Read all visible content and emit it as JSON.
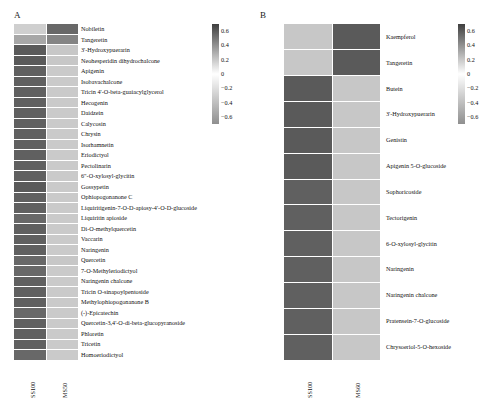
{
  "figure": {
    "background": "#ffffff",
    "panels": [
      {
        "letter": "A",
        "x_labels": [
          "SS100",
          "MS50"
        ],
        "rows": [
          {
            "label": "Nobiletin",
            "values": [
              -0.3,
              0.55
            ]
          },
          {
            "label": "Tangeretin",
            "values": [
              -0.55,
              0.45
            ]
          },
          {
            "label": "3'-Hydroxypuerarin",
            "values": [
              0.6,
              -0.35
            ]
          },
          {
            "label": "Neohesperidin dihydrochalcone",
            "values": [
              0.6,
              -0.35
            ]
          },
          {
            "label": "Apigenin",
            "values": [
              0.58,
              -0.33
            ]
          },
          {
            "label": "Isobavachalcone",
            "values": [
              0.58,
              -0.33
            ]
          },
          {
            "label": "Tricin 4'-O-beta-guaiacylglycerol",
            "values": [
              0.58,
              -0.33
            ]
          },
          {
            "label": "Hecogenin",
            "values": [
              0.58,
              -0.33
            ]
          },
          {
            "label": "Daidzein",
            "values": [
              0.58,
              -0.33
            ]
          },
          {
            "label": "Calycosin",
            "values": [
              0.58,
              -0.33
            ]
          },
          {
            "label": "Chrysin",
            "values": [
              0.58,
              -0.33
            ]
          },
          {
            "label": "Isorhamnetin",
            "values": [
              0.58,
              -0.33
            ]
          },
          {
            "label": "Eriodictyol",
            "values": [
              0.58,
              -0.33
            ]
          },
          {
            "label": "Pectolinarin",
            "values": [
              0.58,
              -0.33
            ]
          },
          {
            "label": "6\"-O-xylosyl-glycitin",
            "values": [
              0.58,
              -0.33
            ]
          },
          {
            "label": "Gossypetin",
            "values": [
              0.6,
              -0.33
            ]
          },
          {
            "label": "Ophiopogonanone C",
            "values": [
              0.58,
              -0.33
            ]
          },
          {
            "label": "Liquiritigenin-7-O-D-apiosy-4'-O-D-glucoside",
            "values": [
              0.58,
              -0.33
            ]
          },
          {
            "label": "Liquiritin apioside",
            "values": [
              0.55,
              -0.33
            ]
          },
          {
            "label": "Di-O-methylquercetin",
            "values": [
              0.58,
              -0.33
            ]
          },
          {
            "label": "Vaccarin",
            "values": [
              0.58,
              -0.33
            ]
          },
          {
            "label": "Naringenin",
            "values": [
              0.58,
              -0.33
            ]
          },
          {
            "label": "Quercetin",
            "values": [
              0.55,
              -0.35
            ]
          },
          {
            "label": "7-O-Methyleriodictyol",
            "values": [
              0.55,
              -0.33
            ]
          },
          {
            "label": "Naringenin chalcone",
            "values": [
              0.58,
              -0.33
            ]
          },
          {
            "label": "Tricin O-sinapoylpentoside",
            "values": [
              0.58,
              -0.33
            ]
          },
          {
            "label": "Methylophiopogonanone B",
            "values": [
              0.58,
              -0.33
            ]
          },
          {
            "label": "(-)-Epicatechin",
            "values": [
              0.55,
              -0.33
            ]
          },
          {
            "label": "Quercetin-3,4'-O-di-beta-glucopyranoside",
            "values": [
              0.58,
              -0.33
            ]
          },
          {
            "label": "Phloretin",
            "values": [
              0.58,
              -0.33
            ]
          },
          {
            "label": "Tricetin",
            "values": [
              0.58,
              -0.33
            ]
          },
          {
            "label": "Homoeriodictyol",
            "values": [
              0.55,
              -0.33
            ]
          }
        ],
        "colorbar": {
          "ticks": [
            "0.6",
            "0.4",
            "0.2",
            "0",
            "-0.2",
            "-0.4",
            "-0.6"
          ],
          "vmin": -0.7,
          "vmax": 0.7,
          "high_color": "#3f3f3f",
          "mid_color": "#ffffff",
          "low_color": "#8f8f8f"
        }
      },
      {
        "letter": "B",
        "x_labels": [
          "SS100",
          "MS60"
        ],
        "rows": [
          {
            "label": "Kaempferol",
            "values": [
              -0.35,
              0.6
            ]
          },
          {
            "label": "Tangeretin",
            "values": [
              -0.35,
              0.6
            ]
          },
          {
            "label": "Butein",
            "values": [
              0.6,
              -0.35
            ]
          },
          {
            "label": "3'-Hydroxypuerarin",
            "values": [
              0.6,
              -0.35
            ]
          },
          {
            "label": "Genistin",
            "values": [
              0.6,
              -0.35
            ]
          },
          {
            "label": "Apigenin 5-O-glucoside",
            "values": [
              0.6,
              -0.35
            ]
          },
          {
            "label": "Sophoricoside",
            "values": [
              0.58,
              -0.35
            ]
          },
          {
            "label": "Tectorigenin",
            "values": [
              0.58,
              -0.35
            ]
          },
          {
            "label": "6-O-xylosyl-glycitin",
            "values": [
              0.58,
              -0.35
            ]
          },
          {
            "label": "Naringenin",
            "values": [
              0.58,
              -0.35
            ]
          },
          {
            "label": "Naringenin chalcone",
            "values": [
              0.58,
              -0.35
            ]
          },
          {
            "label": "Pratensein-7-O-glucoside",
            "values": [
              0.58,
              -0.35
            ]
          },
          {
            "label": "Chrysoeriol-5-O-hexoside",
            "values": [
              0.58,
              -0.35
            ]
          }
        ],
        "colorbar": {
          "ticks": [
            "0.6",
            "0.4",
            "0.2",
            "0",
            "-0.2",
            "-0.4",
            "-0.6"
          ],
          "vmin": -0.7,
          "vmax": 0.7,
          "high_color": "#3f3f3f",
          "mid_color": "#ffffff",
          "low_color": "#8f8f8f"
        }
      }
    ]
  },
  "chart_data": {
    "type": "heatmap",
    "title": "",
    "panels": [
      {
        "name": "A",
        "columns": [
          "SS100",
          "MS50"
        ],
        "rows": [
          "Nobiletin",
          "Tangeretin",
          "3'-Hydroxypuerarin",
          "Neohesperidin dihydrochalcone",
          "Apigenin",
          "Isobavachalcone",
          "Tricin 4'-O-beta-guaiacylglycerol",
          "Hecogenin",
          "Daidzein",
          "Calycosin",
          "Chrysin",
          "Isorhamnetin",
          "Eriodictyol",
          "Pectolinarin",
          "6\"-O-xylosyl-glycitin",
          "Gossypetin",
          "Ophiopogonanone C",
          "Liquiritigenin-7-O-D-apiosy-4'-O-D-glucoside",
          "Liquiritin apioside",
          "Di-O-methylquercetin",
          "Vaccarin",
          "Naringenin",
          "Quercetin",
          "7-O-Methyleriodictyol",
          "Naringenin chalcone",
          "Tricin O-sinapoylpentoside",
          "Methylophiopogonanone B",
          "(-)-Epicatechin",
          "Quercetin-3,4'-O-di-beta-glucopyranoside",
          "Phloretin",
          "Tricetin",
          "Homoeriodictyol"
        ],
        "values": [
          [
            -0.3,
            0.55
          ],
          [
            -0.55,
            0.45
          ],
          [
            0.6,
            -0.35
          ],
          [
            0.6,
            -0.35
          ],
          [
            0.58,
            -0.33
          ],
          [
            0.58,
            -0.33
          ],
          [
            0.58,
            -0.33
          ],
          [
            0.58,
            -0.33
          ],
          [
            0.58,
            -0.33
          ],
          [
            0.58,
            -0.33
          ],
          [
            0.58,
            -0.33
          ],
          [
            0.58,
            -0.33
          ],
          [
            0.58,
            -0.33
          ],
          [
            0.58,
            -0.33
          ],
          [
            0.58,
            -0.33
          ],
          [
            0.6,
            -0.33
          ],
          [
            0.58,
            -0.33
          ],
          [
            0.58,
            -0.33
          ],
          [
            0.55,
            -0.33
          ],
          [
            0.58,
            -0.33
          ],
          [
            0.58,
            -0.33
          ],
          [
            0.58,
            -0.33
          ],
          [
            0.55,
            -0.35
          ],
          [
            0.55,
            -0.33
          ],
          [
            0.58,
            -0.33
          ],
          [
            0.58,
            -0.33
          ],
          [
            0.58,
            -0.33
          ],
          [
            0.55,
            -0.33
          ],
          [
            0.58,
            -0.33
          ],
          [
            0.58,
            -0.33
          ],
          [
            0.58,
            -0.33
          ],
          [
            0.55,
            -0.33
          ]
        ],
        "colorbar_ticks": [
          0.6,
          0.4,
          0.2,
          0,
          -0.2,
          -0.4,
          -0.6
        ],
        "zlim": [
          -0.7,
          0.7
        ]
      },
      {
        "name": "B",
        "columns": [
          "SS100",
          "MS60"
        ],
        "rows": [
          "Kaempferol",
          "Tangeretin",
          "Butein",
          "3'-Hydroxypuerarin",
          "Genistin",
          "Apigenin 5-O-glucoside",
          "Sophoricoside",
          "Tectorigenin",
          "6-O-xylosyl-glycitin",
          "Naringenin",
          "Naringenin chalcone",
          "Pratensein-7-O-glucoside",
          "Chrysoeriol-5-O-hexoside"
        ],
        "values": [
          [
            -0.35,
            0.6
          ],
          [
            -0.35,
            0.6
          ],
          [
            0.6,
            -0.35
          ],
          [
            0.6,
            -0.35
          ],
          [
            0.6,
            -0.35
          ],
          [
            0.6,
            -0.35
          ],
          [
            0.58,
            -0.35
          ],
          [
            0.58,
            -0.35
          ],
          [
            0.58,
            -0.35
          ],
          [
            0.58,
            -0.35
          ],
          [
            0.58,
            -0.35
          ],
          [
            0.58,
            -0.35
          ],
          [
            0.58,
            -0.35
          ]
        ],
        "colorbar_ticks": [
          0.6,
          0.4,
          0.2,
          0,
          -0.2,
          -0.4,
          -0.6
        ],
        "zlim": [
          -0.7,
          0.7
        ]
      }
    ],
    "grid": false,
    "legend": "colorbar-right-of-each-panel"
  }
}
